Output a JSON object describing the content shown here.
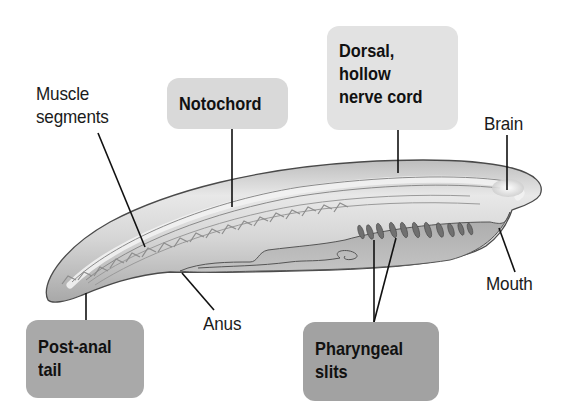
{
  "diagram": {
    "labels": {
      "muscle_segments": [
        "Muscle",
        "segments"
      ],
      "brain": "Brain",
      "mouth": "Mouth",
      "anus": "Anus"
    },
    "boxes": {
      "notochord": [
        "Notochord"
      ],
      "dorsal_nerve_cord": [
        "Dorsal,",
        "hollow",
        "nerve cord"
      ],
      "post_anal_tail": [
        "Post-anal",
        "tail"
      ],
      "pharyngeal_slits": [
        "Pharyngeal",
        "slits"
      ]
    },
    "colors": {
      "background": "#ffffff",
      "body_fill": "#c8c8c8",
      "body_light": "#e6e6e6",
      "outline": "#4a4a4a",
      "slits": "#6e6e6e",
      "box_light": "#d9d9d9",
      "box_lighter": "#e2e2e2",
      "box_dark": "#a9a9a9",
      "text": "#1a1a1a"
    }
  }
}
